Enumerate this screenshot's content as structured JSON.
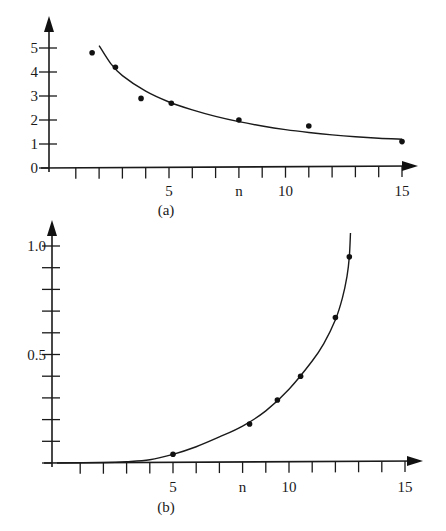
{
  "colors": {
    "ink": "#1a1a1a",
    "background": "#ffffff"
  },
  "chart_data": [
    {
      "type": "scatter",
      "panel_label": "(a)",
      "title": "",
      "xlabel": "n",
      "ylabel": "",
      "x_tick_labels": [
        {
          "x": 5,
          "label": "5"
        },
        {
          "x": 8,
          "label": "n"
        },
        {
          "x": 10,
          "label": "10"
        },
        {
          "x": 15,
          "label": "15"
        }
      ],
      "x_ticks": [
        1,
        2,
        3,
        4,
        5,
        6,
        7,
        8,
        9,
        10,
        11,
        12,
        13,
        14,
        15
      ],
      "y_tick_labels": [
        {
          "y": 0,
          "label": "0"
        },
        {
          "y": 1,
          "label": "1"
        },
        {
          "y": 2,
          "label": "2"
        },
        {
          "y": 3,
          "label": "3"
        },
        {
          "y": 4,
          "label": "4"
        },
        {
          "y": 5,
          "label": "5"
        }
      ],
      "xlim": [
        0,
        16
      ],
      "ylim": [
        0,
        5.5
      ],
      "grid": false,
      "legend": null,
      "points": [
        {
          "x": 1.7,
          "y": 4.8
        },
        {
          "x": 2.7,
          "y": 4.2
        },
        {
          "x": 3.8,
          "y": 2.9
        },
        {
          "x": 5.1,
          "y": 2.7
        },
        {
          "x": 8.0,
          "y": 2.0
        },
        {
          "x": 11.0,
          "y": 1.75
        },
        {
          "x": 15.0,
          "y": 1.1
        }
      ],
      "fit_curve": {
        "description": "decreasing fitted curve",
        "x": [
          2.0,
          2.5,
          3.0,
          4.0,
          5.0,
          6.0,
          7.0,
          8.0,
          9.0,
          10.0,
          11.0,
          12.0,
          13.0,
          14.0,
          15.0
        ],
        "y": [
          5.1,
          4.35,
          3.85,
          3.2,
          2.75,
          2.42,
          2.15,
          1.93,
          1.75,
          1.6,
          1.48,
          1.38,
          1.3,
          1.24,
          1.2
        ]
      }
    },
    {
      "type": "scatter",
      "panel_label": "(b)",
      "title": "",
      "xlabel": "n",
      "ylabel": "",
      "x_tick_labels": [
        {
          "x": 5,
          "label": "5"
        },
        {
          "x": 8,
          "label": "n"
        },
        {
          "x": 10,
          "label": "10"
        },
        {
          "x": 15,
          "label": "15"
        }
      ],
      "x_ticks": [
        1,
        2,
        3,
        4,
        5,
        6,
        7,
        8,
        9,
        10,
        11,
        12,
        13,
        14,
        15
      ],
      "y_ticks": [
        0.1,
        0.2,
        0.3,
        0.4,
        0.5,
        0.6,
        0.7,
        0.8,
        0.9,
        1.0
      ],
      "y_tick_labels": [
        {
          "y": 0.5,
          "label": "0.5"
        },
        {
          "y": 1.0,
          "label": "1.0"
        }
      ],
      "xlim": [
        0,
        16
      ],
      "ylim": [
        0,
        1.1
      ],
      "grid": false,
      "legend": null,
      "points": [
        {
          "x": 5.0,
          "y": 0.04
        },
        {
          "x": 8.3,
          "y": 0.18
        },
        {
          "x": 9.5,
          "y": 0.29
        },
        {
          "x": 10.5,
          "y": 0.4
        },
        {
          "x": 12.0,
          "y": 0.67
        },
        {
          "x": 12.6,
          "y": 0.95
        }
      ],
      "fit_curve": {
        "description": "increasing fitted curve, steep near n≈12.7",
        "x": [
          0,
          2,
          3,
          4,
          5,
          6,
          7,
          8,
          9,
          10,
          11,
          11.5,
          12,
          12.3,
          12.5,
          12.6,
          12.65
        ],
        "y": [
          0.0,
          0.002,
          0.006,
          0.015,
          0.04,
          0.075,
          0.12,
          0.17,
          0.24,
          0.34,
          0.47,
          0.55,
          0.66,
          0.76,
          0.86,
          0.95,
          1.06
        ]
      }
    }
  ]
}
